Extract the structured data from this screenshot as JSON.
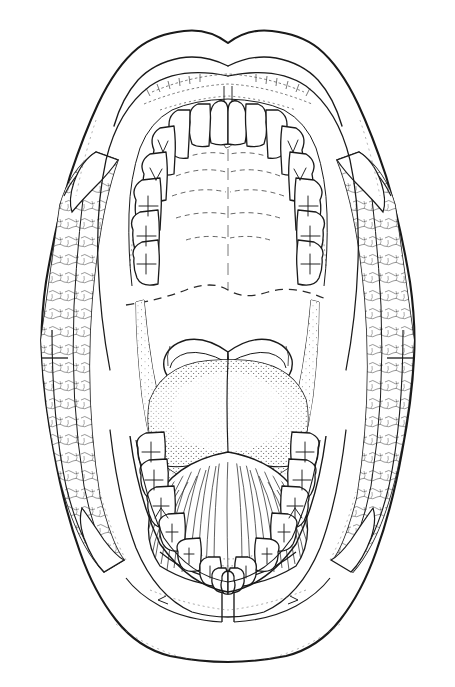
{
  "document": {
    "title": "Oral Cavity — Anterior View",
    "kind": "anatomical line drawing",
    "medium": "black ink line art on white background",
    "view": "open mouth, cheeks retracted, anterior (frontal) view",
    "caption": "",
    "text_labels": [],
    "leader_lines": 0
  },
  "canvas": {
    "width": 455,
    "height": 687,
    "background_color": "#ffffff",
    "ink_color": "#1a1a1a",
    "stipple_color": "#3a3a3a",
    "hairline_color": "#555555"
  },
  "structures": {
    "upper_lip": {
      "name": "Upper lip (labium superius)",
      "cupids_bow_apex_y": 43,
      "span_x": [
        148,
        310
      ]
    },
    "lower_lip": {
      "name": "Lower lip (labium inferius)",
      "lowest_y": 648,
      "span_x": [
        150,
        310
      ]
    },
    "left_cheek": {
      "name": "Left buccal mucosa (retracted cheek)",
      "texture": "stippled / irregular vascular mottling",
      "commissure_line_y": 358
    },
    "right_cheek": {
      "name": "Right buccal mucosa (retracted cheek)",
      "texture": "stippled / irregular vascular mottling",
      "commissure_line_y": 358
    },
    "hard_palate": {
      "name": "Hard palate",
      "features": [
        "palatine raphe",
        "transverse palatine rugae",
        "incisive papilla"
      ],
      "rugae_count": 5
    },
    "soft_palate": {
      "name": "Soft palate",
      "boundary_style": "dashed",
      "boundary_y": 293
    },
    "uvula": {
      "name": "Uvula",
      "visible": false
    },
    "tonsils": {
      "name": "Palatine tonsils / palatoglossal arches",
      "count": 2,
      "center_y": 360
    },
    "tongue_dorsum": {
      "name": "Tongue, dorsal surface (posterior)",
      "texture": "stippled papillae",
      "center": [
        228,
        400
      ]
    },
    "tongue_body": {
      "name": "Tongue, body with median sulcus",
      "texture": "fine radiating hatch lines",
      "median_sulcus_x": 228
    },
    "labial_frenulum": {
      "name": "Lower labial frenulum",
      "x": 228,
      "y_span": [
        575,
        605
      ]
    },
    "vestibular_sulcus": {
      "name": "Mandibular vestibular sulcus",
      "y": 590
    }
  },
  "dentition": {
    "upper_arch": {
      "name": "Maxillary arch",
      "quadrants": {
        "upper_left": [
          "central incisor",
          "lateral incisor",
          "canine",
          "first premolar",
          "second premolar",
          "first molar",
          "second molar",
          "third molar"
        ],
        "upper_right": [
          "central incisor",
          "lateral incisor",
          "canine",
          "first premolar",
          "second premolar",
          "first molar",
          "second molar",
          "third molar"
        ]
      },
      "teeth_count": 16
    },
    "lower_arch": {
      "name": "Mandibular arch",
      "quadrants": {
        "lower_left": [
          "central incisor",
          "lateral incisor",
          "canine",
          "first premolar",
          "second premolar",
          "first molar",
          "second molar",
          "third molar"
        ],
        "lower_right": [
          "central incisor",
          "lateral incisor",
          "canine",
          "first premolar",
          "second premolar",
          "first molar",
          "second molar",
          "third molar"
        ]
      },
      "teeth_count": 16
    },
    "total_teeth": 32,
    "occlusal_markings": "Y-shaped and cross-shaped fissure patterns on molar and premolar crowns"
  },
  "render": {
    "stroke_outer": 2.1,
    "stroke_main": 1.4,
    "stroke_tooth": 1.3,
    "stroke_detail": 0.8,
    "stroke_hair": 0.55,
    "dash_palate": "7 5",
    "dash_rugae": "3 3"
  }
}
